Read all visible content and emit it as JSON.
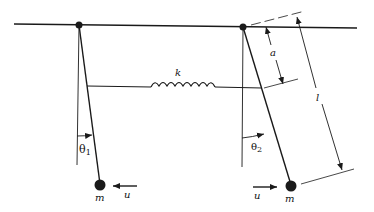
{
  "diagram": {
    "colors": {
      "stroke": "#1a1a1a",
      "background": "#ffffff"
    },
    "labels": {
      "spring": "k",
      "attach_distance": "a",
      "rod_length": "l",
      "theta1_sym": "θ",
      "theta1_sub": "1",
      "theta2_sym": "θ",
      "theta2_sub": "2",
      "mass1": "m",
      "mass2": "m",
      "force1": "u",
      "force2": "u"
    },
    "elements": {
      "ceiling": "horizontal support line",
      "pendulum_1": {
        "pivot": "left",
        "angle": "θ1",
        "force_direction": "left"
      },
      "pendulum_2": {
        "pivot": "right",
        "angle": "θ2",
        "force_direction": "right"
      }
    }
  }
}
